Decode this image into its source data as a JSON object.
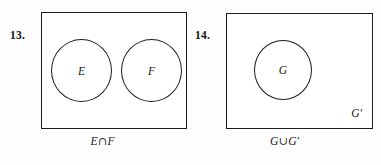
{
  "page": {
    "type": "textbook-exercise-figure",
    "background_color": "#fdfdfd",
    "ink_color": "#1c1c1c"
  },
  "exercises": [
    {
      "number": "13.",
      "diagram": {
        "kind": "venn-diagram",
        "universe_shape": "rectangle",
        "universe_label": "",
        "circles": [
          {
            "label": "E"
          },
          {
            "label": "F"
          }
        ]
      },
      "caption": {
        "full": "E∩F",
        "left_operand": "E",
        "operator": "∩",
        "operator_name": "intersection",
        "right_operand": "F"
      }
    },
    {
      "number": "14.",
      "diagram": {
        "kind": "venn-diagram",
        "universe_shape": "rectangle",
        "universe_label": "G′",
        "circles": [
          {
            "label": "G"
          }
        ]
      },
      "caption": {
        "full": "G∪G′",
        "left_operand": "G",
        "operator": "∪",
        "operator_name": "union",
        "right_operand": "G′"
      }
    }
  ]
}
